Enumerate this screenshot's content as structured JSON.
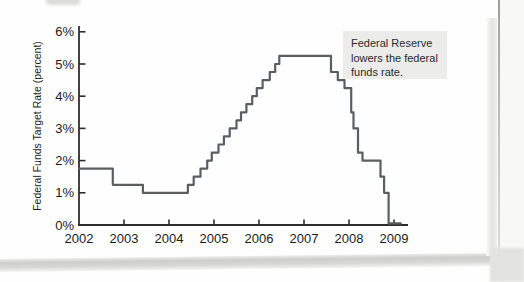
{
  "colors": {
    "line": "#5b5e60",
    "axis": "#2e2e2e",
    "tick": "#2e2e2e",
    "text": "#1c1c1c",
    "annotation_bg": "#ececea",
    "page_bg": "#fefefe",
    "page_edge": "#c3c3c1"
  },
  "chart_data": {
    "type": "line",
    "line_style": "step-after",
    "title": "",
    "xlabel": "",
    "ylabel": "Federal Funds Target Rate (percent)",
    "xlim": [
      2002,
      2009.3
    ],
    "ylim": [
      0,
      6
    ],
    "grid": false,
    "legend": "none",
    "x_ticks": [
      2002,
      2003,
      2004,
      2005,
      2006,
      2007,
      2008,
      2009
    ],
    "y_tick_labels": [
      "0%",
      "1%",
      "2%",
      "3%",
      "4%",
      "5%",
      "6%"
    ],
    "annotation": {
      "text": "Federal Reserve lowers the federal funds rate.",
      "lines": [
        "Federal Reserve",
        "lowers the federal",
        "funds rate."
      ]
    },
    "series": [
      {
        "name": "Federal funds target rate (percent)",
        "points": [
          [
            2002.0,
            1.75
          ],
          [
            2002.75,
            1.25
          ],
          [
            2003.42,
            1.0
          ],
          [
            2004.42,
            1.25
          ],
          [
            2004.55,
            1.5
          ],
          [
            2004.7,
            1.75
          ],
          [
            2004.85,
            2.0
          ],
          [
            2004.95,
            2.25
          ],
          [
            2005.1,
            2.5
          ],
          [
            2005.22,
            2.75
          ],
          [
            2005.35,
            3.0
          ],
          [
            2005.5,
            3.25
          ],
          [
            2005.6,
            3.5
          ],
          [
            2005.72,
            3.75
          ],
          [
            2005.85,
            4.0
          ],
          [
            2005.95,
            4.25
          ],
          [
            2006.08,
            4.5
          ],
          [
            2006.24,
            4.75
          ],
          [
            2006.36,
            5.0
          ],
          [
            2006.45,
            5.25
          ],
          [
            2007.6,
            4.75
          ],
          [
            2007.75,
            4.5
          ],
          [
            2007.9,
            4.25
          ],
          [
            2008.05,
            3.5
          ],
          [
            2008.1,
            3.0
          ],
          [
            2008.2,
            2.25
          ],
          [
            2008.3,
            2.0
          ],
          [
            2008.7,
            1.5
          ],
          [
            2008.78,
            1.0
          ],
          [
            2008.88,
            0.05
          ],
          [
            2009.15,
            0.05
          ]
        ]
      }
    ]
  }
}
